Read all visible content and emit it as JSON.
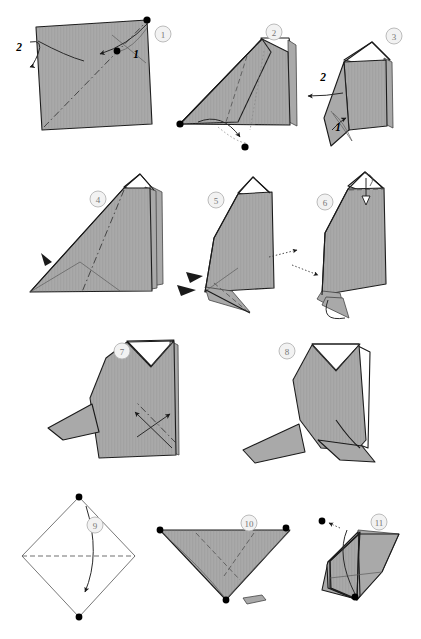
{
  "document": {
    "kind": "origami-instruction-diagram",
    "title": "Origami folding sequence",
    "page_width": 421,
    "page_height": 639,
    "background_color": "#ffffff"
  },
  "palette": {
    "paper_front": "#a9a9a9",
    "paper_back": "#ffffff",
    "ink": "#1a1a1a",
    "badge_fill": "#f2f2f2",
    "badge_stroke": "#b4b4b4",
    "badge_text": "#777777",
    "label_text": "#000000",
    "hidden_line": "#8a8a8a"
  },
  "rows": [
    {
      "name": "row-1",
      "steps": [
        "1",
        "2",
        "3"
      ]
    },
    {
      "name": "row-2",
      "steps": [
        "4",
        "5",
        "6"
      ]
    },
    {
      "name": "row-3",
      "steps": [
        "7",
        "8"
      ]
    },
    {
      "name": "row-4",
      "steps": [
        "9",
        "10",
        "11"
      ]
    }
  ],
  "steps": [
    {
      "number": "1",
      "badge": {
        "x": 163,
        "y": 34,
        "r": 8
      },
      "shape": "square sheet, gray side up, rotated slightly",
      "fold_lines": [
        "diagonal valley from bottom-left to top-right"
      ],
      "labels": [
        {
          "text": "2",
          "x": 19,
          "y": 47
        },
        {
          "text": "1",
          "x": 136,
          "y": 54
        }
      ],
      "reference_dots": 2,
      "arrows": [
        "curved fold arrow toward lower-left",
        "small curl arrow at left edge"
      ]
    },
    {
      "number": "2",
      "badge": {
        "x": 274,
        "y": 32,
        "r": 8
      },
      "shape": "folded triangle with raised flap at top right",
      "fold_lines": [
        "valley crease",
        "hidden dotted crease"
      ],
      "labels": [],
      "reference_dots": 2,
      "arrows": [
        "curved arrow sweeping down to the right",
        "dotted guide arc"
      ]
    },
    {
      "number": "3",
      "badge": {
        "x": 394,
        "y": 36,
        "r": 8
      },
      "shape": "upright folded form with pointed lower flap",
      "fold_lines": [
        "light crease lines on lower flap"
      ],
      "labels": [
        {
          "text": "2",
          "x": 323,
          "y": 77
        },
        {
          "text": "1",
          "x": 338,
          "y": 127
        }
      ],
      "reference_dots": 0,
      "arrows": [
        "arrow pointing left",
        "short arrow within lower flap"
      ]
    },
    {
      "number": "4",
      "badge": {
        "x": 98,
        "y": 199,
        "r": 8
      },
      "shape": "large triangle with layered edge at right",
      "fold_lines": [
        "dash-dot valley through the middle",
        "creases converging at lower left"
      ],
      "labels": [],
      "reference_dots": 0,
      "arrows": [
        "solid black push arrowhead at left edge"
      ]
    },
    {
      "number": "5",
      "badge": {
        "x": 216,
        "y": 200,
        "r": 8
      },
      "shape": "body form with narrow flap folding out at lower left",
      "fold_lines": [
        "dashed crease on lower flap"
      ],
      "labels": [],
      "reference_dots": 0,
      "arrows": [
        "two solid black arrowheads at left",
        "dotted x-ray arrow from the right"
      ]
    },
    {
      "number": "6",
      "badge": {
        "x": 325,
        "y": 202,
        "r": 8
      },
      "shape": "body form with flap swung down at lower left",
      "fold_lines": [
        "dashed crease across top"
      ],
      "labels": [],
      "reference_dots": 0,
      "arrows": [
        "hollow push arrow at top",
        "dotted x-ray arrow at left",
        "curved arrow at bottom flap"
      ]
    },
    {
      "number": "7",
      "badge": {
        "x": 122,
        "y": 351,
        "r": 8
      },
      "shape": "penguin-like body with white V notch at the top and tail at left",
      "fold_lines": [
        "dash-dot crease across the lower right"
      ],
      "labels": [],
      "reference_dots": 0,
      "arrows": [
        "two crossing fold arrows on the lower right"
      ]
    },
    {
      "number": "8",
      "badge": {
        "x": 287,
        "y": 351,
        "r": 8
      },
      "shape": "finished rounded body with white V notch, tail at left and foot at right",
      "fold_lines": [],
      "labels": [],
      "reference_dots": 0,
      "arrows": []
    },
    {
      "number": "9",
      "badge": {
        "x": 95,
        "y": 525,
        "r": 8
      },
      "shape": "white square rotated to a diamond",
      "fold_lines": [
        "horizontal dashed valley across the middle"
      ],
      "labels": [],
      "reference_dots": 2,
      "arrows": [
        "curved arrow folding top point down"
      ]
    },
    {
      "number": "10",
      "badge": {
        "x": 249,
        "y": 523,
        "r": 8
      },
      "shape": "wide downward triangle, gray side showing",
      "fold_lines": [
        "two dashed diagonal creases to the bottom point"
      ],
      "labels": [],
      "reference_dots": 2,
      "arrows": []
    },
    {
      "number": "11",
      "badge": {
        "x": 379,
        "y": 522,
        "r": 8
      },
      "shape": "small folded form with raised points",
      "fold_lines": [
        "light creases"
      ],
      "labels": [],
      "reference_dots": 3,
      "arrows": [
        "curved arrow to upper-left reference dot"
      ]
    }
  ]
}
